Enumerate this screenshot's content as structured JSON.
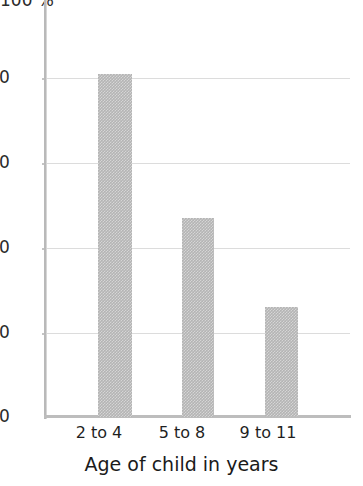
{
  "chart_data": {
    "type": "bar",
    "title": "",
    "subtitle": "",
    "xlabel": "Age of child in years",
    "ylabel": "",
    "yunit": "100 %",
    "categories": [
      "2 to 4",
      "5 to 8",
      "9 to 11"
    ],
    "values": [
      81,
      47,
      26
    ],
    "ylim": [
      0,
      100
    ],
    "yticks": [
      0,
      20,
      40,
      60,
      80
    ],
    "ytick_labels": [
      "0",
      "20",
      "40",
      "60",
      "80"
    ],
    "grid": "horizontal",
    "legend": "none",
    "bar_color": "#b4b4b4",
    "gridline_color": "#dcdcdc",
    "axis_color": "#bdbdbd",
    "text_color": "#1f1f1f",
    "annotations": []
  },
  "axis": {
    "unit_label": "100 %",
    "tick_0": "0",
    "tick_20": "20",
    "tick_40": "40",
    "tick_60": "60",
    "tick_80": "80"
  },
  "xaxis": {
    "title": "Age of child in years",
    "cat_0": "2 to 4",
    "cat_1": "5 to 8",
    "cat_2": "9 to 11"
  }
}
